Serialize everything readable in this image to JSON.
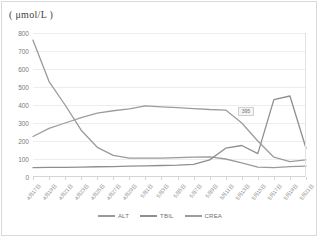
{
  "chart_data": {
    "type": "line",
    "title": "( μmol/L )",
    "xlabel": "",
    "ylabel": "( μmol/L )",
    "ylim": [
      0,
      800
    ],
    "ytick_step": 100,
    "yticks": [
      "800",
      "700",
      "600",
      "500",
      "400",
      "300",
      "200",
      "100",
      "0"
    ],
    "grid": true,
    "legend_position": "bottom",
    "categories": [
      "4月17日",
      "4月19日",
      "4月21日",
      "4月23日",
      "4月25日",
      "4月27日",
      "4月29日",
      "5月1日",
      "5月3日",
      "5月5日",
      "5月7日",
      "5月9日",
      "5月11日",
      "5月13日",
      "5月15日",
      "5月17日",
      "5月19日",
      "5月21日"
    ],
    "series": [
      {
        "name": "ALT",
        "color": "#9a9a9a",
        "values": [
          760,
          530,
          400,
          260,
          165,
          120,
          105,
          105,
          105,
          108,
          110,
          112,
          100,
          78,
          55,
          52,
          58,
          60
        ]
      },
      {
        "name": "TBIL",
        "color": "#8f8f8f",
        "values": [
          52,
          53,
          54,
          55,
          57,
          58,
          60,
          62,
          64,
          66,
          70,
          95,
          160,
          175,
          130,
          430,
          450,
          160
        ]
      },
      {
        "name": "CREA",
        "color": "#9d9d9d",
        "values": [
          225,
          270,
          300,
          330,
          355,
          368,
          378,
          395,
          390,
          385,
          380,
          375,
          372,
          300,
          200,
          110,
          85,
          95
        ]
      }
    ],
    "annotation": {
      "text": "395",
      "series": "CREA",
      "x_index": 13
    }
  },
  "legend": {
    "items": [
      {
        "label": "ALT",
        "color": "#9a9a9a"
      },
      {
        "label": "TBIL",
        "color": "#8f8f8f"
      },
      {
        "label": "CREA",
        "color": "#9d9d9d"
      }
    ]
  }
}
